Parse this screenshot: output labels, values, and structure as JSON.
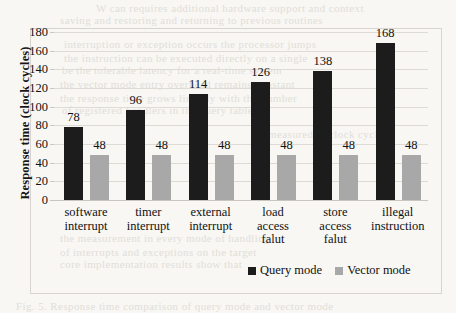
{
  "chart_data": {
    "type": "bar",
    "title": "",
    "xlabel": "",
    "ylabel": "Response time  (clock cycles)",
    "ylim": [
      0,
      180
    ],
    "ytick_step": 20,
    "yticks": [
      180,
      160,
      140,
      120,
      100,
      80,
      60,
      40,
      20,
      0
    ],
    "grid": true,
    "legend_position": "bottom-right",
    "categories": [
      [
        "software",
        "interrupt"
      ],
      [
        "timer",
        "interrupt"
      ],
      [
        "external",
        "interrupt"
      ],
      [
        "load",
        "access",
        "falut"
      ],
      [
        "store",
        "access",
        "falut"
      ],
      [
        "illegal",
        "instruction"
      ]
    ],
    "series": [
      {
        "name": "Query mode",
        "color": "#1c1c1c",
        "values": [
          78,
          96,
          114,
          126,
          138,
          168
        ]
      },
      {
        "name": "Vector mode",
        "color": "#a8a8a8",
        "values": [
          48,
          48,
          48,
          48,
          48,
          48
        ]
      }
    ]
  },
  "bleed_text": {
    "lines": [
      {
        "text": "W  can  requires additional hardware support and  context",
        "x": 96,
        "y": 2
      },
      {
        "text": "saving  and  restoring  and  returning  to  previous  routines",
        "x": 60,
        "y": 14
      },
      {
        "text": "interruption  or  exception  occurs  the  processor  jumps",
        "x": 64,
        "y": 38
      },
      {
        "text": "the  instruction  can  be  executed  directly  on  a  single",
        "x": 64,
        "y": 52
      },
      {
        "text": "be  the  tolerable  latency  for  a  real-time  system",
        "x": 62,
        "y": 64
      },
      {
        "text": "the  vector  mode  entry  overhead  remains  constant",
        "x": 60,
        "y": 78
      },
      {
        "text": "the  response  time  grows  linearly  with  the  number",
        "x": 60,
        "y": 92
      },
      {
        "text": "of  registered  handlers  in  the  query  table",
        "x": 62,
        "y": 104
      },
      {
        "text": "measured  in  clock  cycles",
        "x": 268,
        "y": 128
      },
      {
        "text": "the  measurement  in  every  mode  of  handling",
        "x": 60,
        "y": 232
      },
      {
        "text": "of  interrupts  and  exceptions  on  the  target",
        "x": 60,
        "y": 246
      },
      {
        "text": "core  implementation  results  show  that",
        "x": 60,
        "y": 258
      },
      {
        "text": "Fig.  5.  Response  time  comparison  of  query  mode  and  vector  mode",
        "x": 16,
        "y": 300
      }
    ]
  }
}
